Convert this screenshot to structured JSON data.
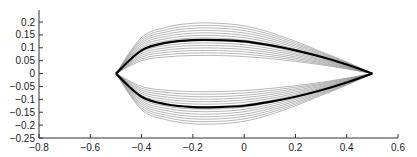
{
  "chart_data": {
    "type": "line",
    "title": "",
    "xlabel": "",
    "ylabel": "",
    "xlim": [
      -0.8,
      0.6
    ],
    "ylim": [
      -0.25,
      0.25
    ],
    "x_ticks": [
      "-0.8",
      "-0.6",
      "-0.4",
      "-0.2",
      "0",
      "0.2",
      "0.4",
      "0.6"
    ],
    "y_ticks": [
      "0.2",
      "0.15",
      "0.1",
      "0.05",
      "0",
      "-0.05",
      "-0.1",
      "-0.15",
      "-0.2",
      "-0.25"
    ],
    "grid": false,
    "series": [
      {
        "name": "bold contour",
        "x": [
          -0.5,
          -0.4,
          -0.3,
          -0.2,
          -0.1,
          0,
          0.1,
          0.2,
          0.3,
          0.4,
          0.5
        ],
        "y_upper": [
          0,
          0.09,
          0.12,
          0.13,
          0.13,
          0.125,
          0.11,
          0.09,
          0.065,
          0.035,
          0
        ],
        "y_lower": [
          0,
          -0.09,
          -0.12,
          -0.13,
          -0.13,
          -0.125,
          -0.11,
          -0.09,
          -0.065,
          -0.035,
          0
        ]
      },
      {
        "name": "outer contour",
        "x": [
          -0.5,
          -0.4,
          -0.3,
          -0.2,
          -0.1,
          0,
          0.1,
          0.2,
          0.3,
          0.4,
          0.5
        ],
        "y_upper": [
          0,
          0.14,
          0.18,
          0.195,
          0.195,
          0.185,
          0.16,
          0.125,
          0.085,
          0.045,
          0
        ],
        "y_lower": [
          0,
          -0.14,
          -0.18,
          -0.195,
          -0.195,
          -0.185,
          -0.16,
          -0.125,
          -0.085,
          -0.045,
          0
        ]
      },
      {
        "name": "inner contour",
        "x": [
          -0.5,
          -0.4,
          -0.3,
          -0.2,
          -0.1,
          0,
          0.1,
          0.2,
          0.3,
          0.4,
          0.5
        ],
        "y_upper": [
          0,
          0.05,
          0.065,
          0.07,
          0.07,
          0.066,
          0.058,
          0.047,
          0.034,
          0.018,
          0
        ],
        "y_lower": [
          0,
          -0.05,
          -0.065,
          -0.07,
          -0.07,
          -0.066,
          -0.058,
          -0.047,
          -0.034,
          -0.018,
          0
        ]
      }
    ],
    "colors": {
      "thin": "#888888",
      "bold": "#000000",
      "axis": "#333333"
    }
  }
}
